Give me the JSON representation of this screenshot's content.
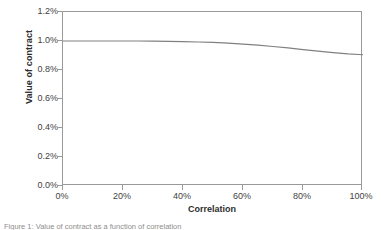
{
  "chart_data": {
    "type": "line",
    "title": "",
    "xlabel": "Correlation",
    "ylabel": "Value of contract",
    "xlim": [
      0,
      100
    ],
    "ylim": [
      0,
      1.2
    ],
    "grid": false,
    "legend": null,
    "x_tick_labels": [
      "0%",
      "20%",
      "40%",
      "60%",
      "80%",
      "100%"
    ],
    "x_tick_values": [
      0,
      20,
      40,
      60,
      80,
      100
    ],
    "y_tick_labels": [
      "0.0%",
      "0.2%",
      "0.4%",
      "0.6%",
      "0.8%",
      "1.0%",
      "1.2%"
    ],
    "y_tick_values": [
      0.0,
      0.2,
      0.4,
      0.6,
      0.8,
      1.0,
      1.2
    ],
    "series": [
      {
        "name": "Value of contract",
        "color": "#808080",
        "x": [
          0,
          5,
          10,
          15,
          20,
          25,
          30,
          35,
          40,
          45,
          50,
          55,
          60,
          65,
          70,
          75,
          80,
          85,
          90,
          95,
          100
        ],
        "y": [
          1.0,
          1.0,
          1.0,
          1.0,
          1.0,
          1.0,
          0.999,
          0.998,
          0.996,
          0.993,
          0.99,
          0.985,
          0.979,
          0.971,
          0.962,
          0.952,
          0.941,
          0.93,
          0.92,
          0.911,
          0.905
        ]
      }
    ]
  },
  "axis": {
    "frame_color": "#9a9a9a",
    "tick_color": "#9a9a9a",
    "text_color": "#3f3f3f"
  },
  "caption": {
    "text": "Figure 1: Value of contract as a function of correlation"
  }
}
